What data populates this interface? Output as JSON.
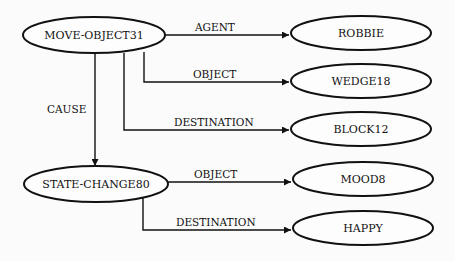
{
  "nodes": {
    "move_object": {
      "label": "MOVE-OBJECT31"
    },
    "robbie": {
      "label": "ROBBIE"
    },
    "wedge": {
      "label": "WEDGE18"
    },
    "block": {
      "label": "BLOCK12"
    },
    "state_change": {
      "label": "STATE-CHANGE80"
    },
    "mood": {
      "label": "MOOD8"
    },
    "happy": {
      "label": "HAPPY"
    }
  },
  "edges": {
    "agent": {
      "label": "AGENT",
      "from": "MOVE-OBJECT31",
      "to": "ROBBIE"
    },
    "object1": {
      "label": "OBJECT",
      "from": "MOVE-OBJECT31",
      "to": "WEDGE18"
    },
    "destination1": {
      "label": "DESTINATION",
      "from": "MOVE-OBJECT31",
      "to": "BLOCK12"
    },
    "cause": {
      "label": "CAUSE",
      "from": "MOVE-OBJECT31",
      "to": "STATE-CHANGE80"
    },
    "object2": {
      "label": "OBJECT",
      "from": "STATE-CHANGE80",
      "to": "MOOD8"
    },
    "destination2": {
      "label": "DESTINATION",
      "from": "STATE-CHANGE80",
      "to": "HAPPY"
    }
  }
}
